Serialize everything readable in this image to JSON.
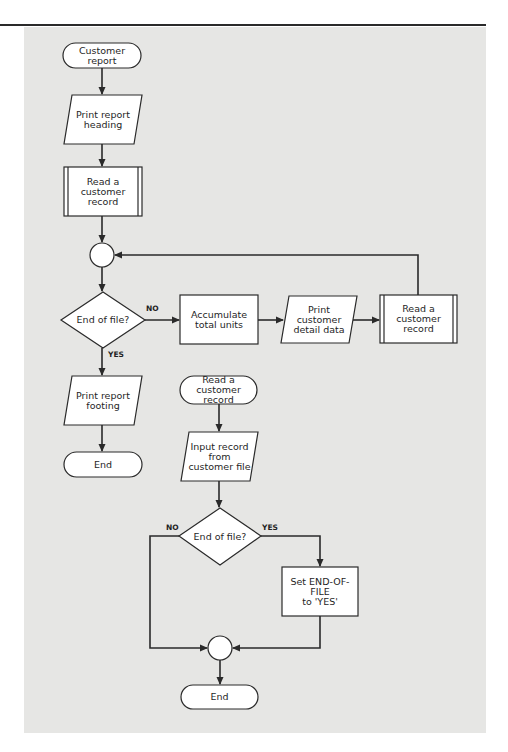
{
  "diagram": {
    "type": "flowchart",
    "colors": {
      "panel": "#e6e6e4",
      "shape_fill": "#ffffff",
      "stroke": "#2a2a2a"
    },
    "main_flow": {
      "start": {
        "shape": "terminal",
        "label": "Customer report"
      },
      "print_heading": {
        "shape": "input-output",
        "label": "Print report\nheading"
      },
      "read_record_1": {
        "shape": "predefined-process",
        "label": "Read a\ncustomer\nrecord"
      },
      "connector_1": {
        "shape": "connector"
      },
      "decision": {
        "shape": "decision",
        "label": "End of file?",
        "no_label": "NO",
        "yes_label": "YES"
      },
      "accumulate": {
        "shape": "process",
        "label": "Accumulate\ntotal units"
      },
      "print_detail": {
        "shape": "input-output",
        "label": "Print\ncustomer\ndetail data"
      },
      "read_record_2": {
        "shape": "predefined-process",
        "label": "Read a\ncustomer\nrecord"
      },
      "print_footing": {
        "shape": "input-output",
        "label": "Print report\nfooting"
      },
      "end": {
        "shape": "terminal",
        "label": "End"
      }
    },
    "subroutine": {
      "start": {
        "shape": "terminal",
        "label": "Read a\ncustomer record"
      },
      "input_record": {
        "shape": "input-output",
        "label": "Input record\nfrom\ncustomer file"
      },
      "decision": {
        "shape": "decision",
        "label": "End of file?",
        "no_label": "NO",
        "yes_label": "YES"
      },
      "set_eof": {
        "shape": "process",
        "label": "Set END-OF-FILE\nto 'YES'"
      },
      "connector": {
        "shape": "connector"
      },
      "end": {
        "shape": "terminal",
        "label": "End"
      }
    }
  }
}
